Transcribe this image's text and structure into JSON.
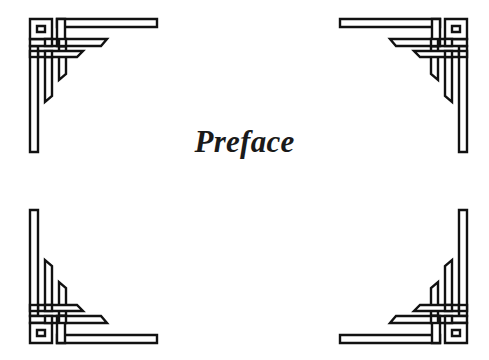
{
  "page": {
    "title": "Preface",
    "background_color": "#ffffff",
    "ornament_color": "#111111"
  },
  "ornaments": [
    {
      "position": "top-left",
      "icon": "celtic-corner-ornament-icon"
    },
    {
      "position": "top-right",
      "icon": "celtic-corner-ornament-icon"
    },
    {
      "position": "bottom-left",
      "icon": "celtic-corner-ornament-icon"
    },
    {
      "position": "bottom-right",
      "icon": "celtic-corner-ornament-icon"
    }
  ]
}
